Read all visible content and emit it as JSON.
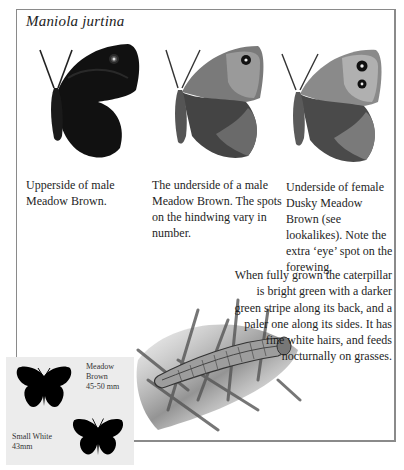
{
  "title": "Maniola jurtina",
  "figures": [
    {
      "id": "upperside-male",
      "caption": "Upperside of male Meadow Brown."
    },
    {
      "id": "underside-male",
      "caption": "The underside of a male Meadow Brown. The spots on the hindwing vary in number."
    },
    {
      "id": "underside-female-dusky",
      "caption": "Underside of female Dusky Meadow Brown (see lookalikes). Note the extra ‘eye’ spot on the forewing."
    }
  ],
  "caterpillar": {
    "description": "When fully grown the caterpillar is bright green with a darker green stripe along its back, and a paler one along its sides. It has fine white hairs, and feeds nocturnally on grasses."
  },
  "size_comparison": {
    "items": [
      {
        "name": "Meadow Brown",
        "size": "45-50 mm"
      },
      {
        "name": "Small White",
        "size": "43mm"
      }
    ]
  },
  "colors": {
    "frame": "#8a8a8a",
    "inset_bg": "#ececec",
    "silhouette": "#000000"
  }
}
